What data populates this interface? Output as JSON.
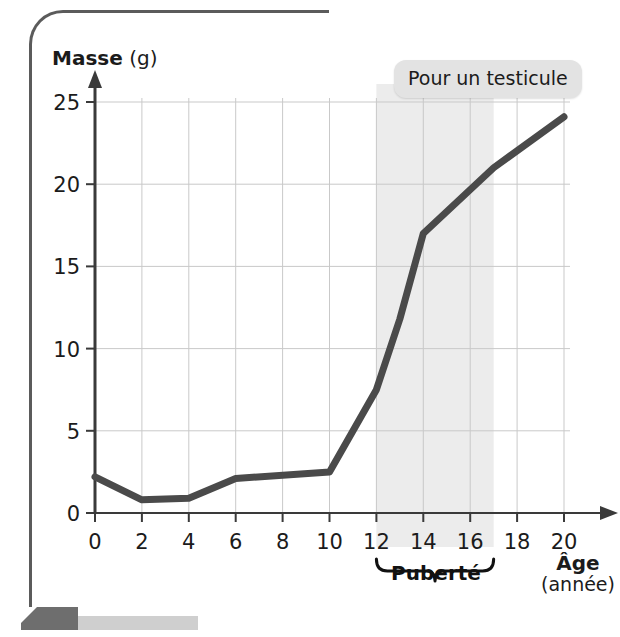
{
  "figure": {
    "callout": "Pour un testicule",
    "puberty_label": "Puberté",
    "y_axis_title_main": "Masse",
    "y_axis_title_unit": "(g)",
    "x_axis_title_main": "Âge",
    "x_axis_title_unit": "(année)"
  },
  "chart_data": {
    "type": "line",
    "title": "Pour un testicule",
    "xlabel": "Âge (année)",
    "ylabel": "Masse (g)",
    "xlim": [
      0,
      20
    ],
    "ylim": [
      0,
      25
    ],
    "xticks": [
      0,
      2,
      4,
      6,
      8,
      10,
      12,
      14,
      16,
      18,
      20
    ],
    "yticks": [
      0,
      5,
      10,
      15,
      20,
      25
    ],
    "xtick_labels": [
      "0",
      "2",
      "4",
      "6",
      "8",
      "10",
      "12",
      "14",
      "16",
      "18",
      "20"
    ],
    "ytick_labels": [
      "0",
      "5",
      "10",
      "15",
      "20",
      "25"
    ],
    "grid": true,
    "legend": "none",
    "line_color": "#4a4a4a",
    "band_color": "#ececec",
    "series": [
      {
        "name": "Masse d'un testicule",
        "x": [
          0,
          2,
          4,
          6,
          10,
          12,
          13,
          14,
          17,
          20
        ],
        "values": [
          2.2,
          0.8,
          0.9,
          2.1,
          2.5,
          7.5,
          11.8,
          17.0,
          21.0,
          24.1
        ]
      }
    ],
    "annotations": [
      {
        "label": "Puberté",
        "type": "x-span-brace",
        "x_start": 12,
        "x_end": 17,
        "shaded": true
      },
      {
        "label": "Pour un testicule",
        "type": "callout-box"
      }
    ]
  }
}
